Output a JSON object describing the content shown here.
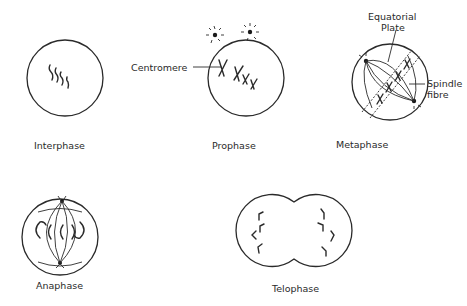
{
  "diagram": {
    "title": "",
    "stages": [
      {
        "id": "interphase",
        "label": "Interphase"
      },
      {
        "id": "prophase",
        "label": "Prophase"
      },
      {
        "id": "metaphase",
        "label": "Metaphase"
      },
      {
        "id": "anaphase",
        "label": "Anaphase"
      },
      {
        "id": "telophase",
        "label": "Telophase"
      }
    ],
    "annotations": {
      "centromere": "Centromere",
      "equatorial_plate_line1": "Equatorial",
      "equatorial_plate_line2": "Plate",
      "spindle_fibre_line1": "Spindle",
      "spindle_fibre_line2": "fibre"
    },
    "colors": {
      "line": "#2a2a2a",
      "background": "#ffffff"
    }
  }
}
